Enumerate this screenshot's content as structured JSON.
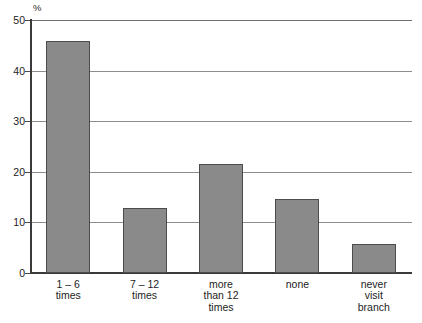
{
  "chart_data": {
    "type": "bar",
    "title": "",
    "subtitle": "",
    "xlabel": "",
    "ylabel": "%",
    "unit_label": "%",
    "categories": [
      "1 – 6\ntimes",
      "7 – 12\ntimes",
      "more\nthan 12\ntimes",
      "none",
      "never\nvisit\nbranch"
    ],
    "category_plain": [
      "1 – 6 times",
      "7 – 12 times",
      "more than 12 times",
      "none",
      "never visit branch"
    ],
    "values": [
      45.8,
      12.8,
      21.5,
      14.6,
      5.7
    ],
    "ylim": [
      0,
      50
    ],
    "yticks": [
      0,
      10,
      20,
      30,
      40,
      50
    ],
    "ytick_labels": [
      "0",
      "10",
      "20",
      "30",
      "40",
      "50"
    ],
    "grid": true,
    "grid_axis": "y",
    "legend": false,
    "legend_position": "none",
    "series": [
      {
        "name": "Branch visits",
        "values": [
          45.8,
          12.8,
          21.5,
          14.6,
          5.7
        ],
        "color": "#8a8a8a"
      }
    ],
    "colors": {
      "bar_fill": "#8a8a8a",
      "bar_border": "#4c4c4c",
      "gridline": "#8d8d8d",
      "axis": "#3a3a3a",
      "background": "#ffffff",
      "text": "#1d1d1d"
    }
  }
}
